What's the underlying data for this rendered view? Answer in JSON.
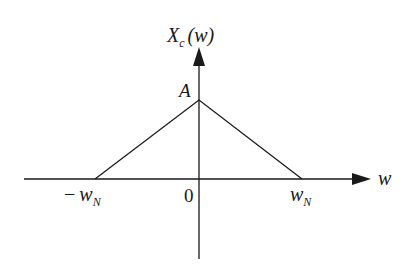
{
  "diagram": {
    "type": "spectrum-plot",
    "y_axis": {
      "label_main": "X",
      "label_sub": "c",
      "label_arg": "(w)"
    },
    "x_axis": {
      "label": "w"
    },
    "peak_label": "A",
    "origin_label": "0",
    "left_tick": {
      "sign": "−",
      "main": "w",
      "sub": "N"
    },
    "right_tick": {
      "main": "w",
      "sub": "N"
    },
    "shape": "triangle",
    "points": [
      {
        "x": "-w_N",
        "y": 0
      },
      {
        "x": 0,
        "y": "A"
      },
      {
        "x": "w_N",
        "y": 0
      }
    ],
    "colors": {
      "stroke": "#1a1a1a",
      "background": "#ffffff"
    }
  }
}
